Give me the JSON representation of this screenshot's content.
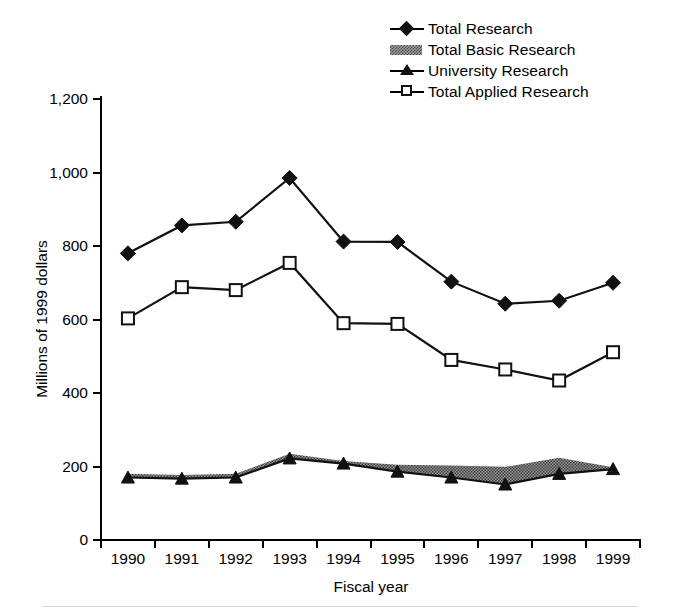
{
  "chart_data": {
    "type": "line",
    "title": "",
    "xlabel": "Fiscal year",
    "ylabel": "Millions of 1999 dollars",
    "categories": [
      "1990",
      "1991",
      "1992",
      "1993",
      "1994",
      "1995",
      "1996",
      "1997",
      "1998",
      "1999"
    ],
    "ylim": [
      0,
      1200
    ],
    "yticks": [
      0,
      200,
      400,
      600,
      800,
      1000,
      1200
    ],
    "ytick_labels": [
      "0",
      "200",
      "400",
      "600",
      "800",
      "1,000",
      "1,200"
    ],
    "grid": false,
    "legend_position": "top-right",
    "series": [
      {
        "name": "Total Research",
        "marker": "filled-diamond",
        "values": [
          780,
          856,
          866,
          985,
          812,
          811,
          703,
          643,
          651,
          700
        ]
      },
      {
        "name": "Total Basic Research",
        "marker": "shaded-band",
        "values": [
          180,
          177,
          180,
          235,
          215,
          205,
          203,
          199,
          224,
          198
        ]
      },
      {
        "name": "University Research",
        "marker": "filled-triangle",
        "values": [
          170,
          167,
          170,
          222,
          208,
          186,
          170,
          151,
          180,
          193
        ]
      },
      {
        "name": "Total Applied Research",
        "marker": "open-square",
        "values": [
          603,
          688,
          680,
          754,
          590,
          588,
          490,
          464,
          434,
          511
        ]
      }
    ]
  },
  "legend": {
    "items": [
      {
        "label": "Total Research",
        "key": "filled-diamond-icon"
      },
      {
        "label": "Total Basic Research",
        "key": "shaded-band-icon"
      },
      {
        "label": "University Research",
        "key": "filled-triangle-icon"
      },
      {
        "label": "Total Applied Research",
        "key": "open-square-icon"
      }
    ]
  },
  "colors": {
    "line": "#111111",
    "band_fill": "#9a9a9a",
    "background": "#ffffff"
  }
}
